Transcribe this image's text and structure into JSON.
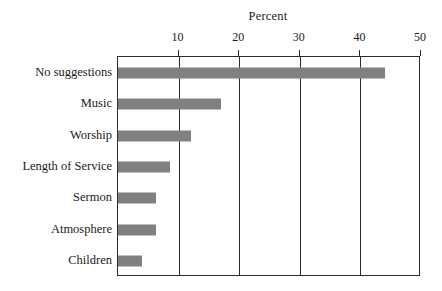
{
  "chart_data": {
    "type": "bar",
    "orientation": "horizontal",
    "title": "Percent",
    "xlabel": "Percent",
    "ylabel": "",
    "categories": [
      "No suggestions",
      "Music",
      "Worship",
      "Length of Service",
      "Sermon",
      "Atmosphere",
      "Children"
    ],
    "values": [
      44,
      17,
      12,
      8.5,
      6.3,
      6.3,
      4
    ],
    "xlim": [
      0,
      50
    ],
    "xticks": [
      0,
      10,
      20,
      30,
      40,
      50
    ],
    "xtick_labels": [
      "",
      "10",
      "20",
      "30",
      "40",
      "50"
    ],
    "grid": "vertical",
    "legend": "none",
    "bar_color": "#808080",
    "frame_color": "#2b2b2b",
    "background": "#ffffff"
  }
}
